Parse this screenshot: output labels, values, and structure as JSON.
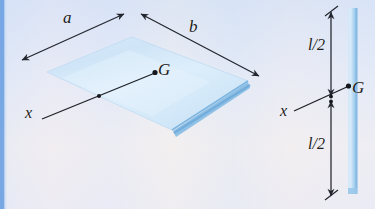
{
  "figure": {
    "background_color": "#f2f5fb",
    "left_edge_stripe_color": "#6b9fe0",
    "plate": {
      "face_color": "#c5e0f5",
      "face_color_light": "#e2eefb",
      "edge_color": "#8cbbe6",
      "thickness_color": "#9ac6ea",
      "outline_color": "#a9cdec"
    },
    "dimension_line_color": "#262a33",
    "axis_line_color": "#1d2026",
    "point_marker_color": "#15171c"
  },
  "left_view": {
    "label_a": "a",
    "label_b": "b",
    "label_G": "G",
    "label_x": "x",
    "description": "Isometric view of thin rectangular plate of sides a and b with mass center G and x axis through G"
  },
  "right_view": {
    "label_l_over_2_top": "l/2",
    "label_l_over_2_bottom": "l/2",
    "label_G": "G",
    "label_x": "x",
    "description": "Edge-on view of the same plate showing total length l split into two halves of l/2 about G"
  }
}
